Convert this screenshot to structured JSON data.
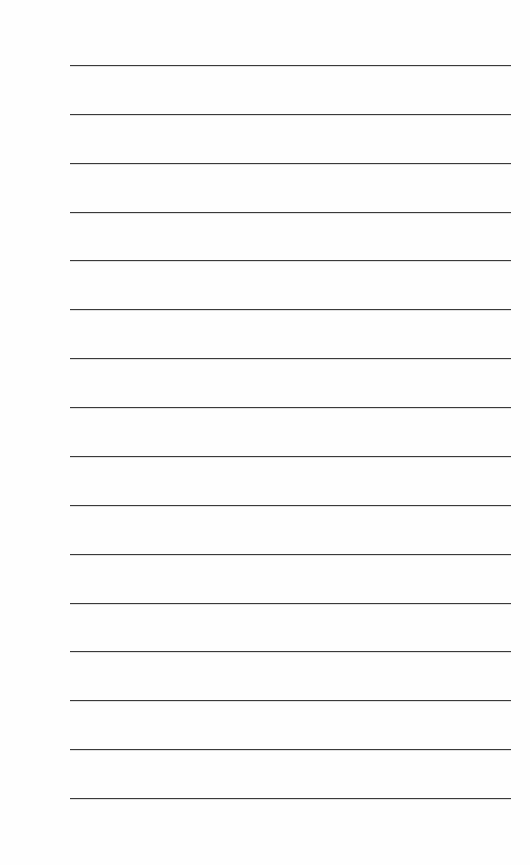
{
  "page": {
    "type": "lined-paper",
    "line_count": 16,
    "line_color": "#3a3a3a",
    "background": "#fefefe",
    "lines": [
      {
        "text": ""
      },
      {
        "text": ""
      },
      {
        "text": ""
      },
      {
        "text": ""
      },
      {
        "text": ""
      },
      {
        "text": ""
      },
      {
        "text": ""
      },
      {
        "text": ""
      },
      {
        "text": ""
      },
      {
        "text": ""
      },
      {
        "text": ""
      },
      {
        "text": ""
      },
      {
        "text": ""
      },
      {
        "text": ""
      },
      {
        "text": ""
      },
      {
        "text": ""
      }
    ]
  }
}
